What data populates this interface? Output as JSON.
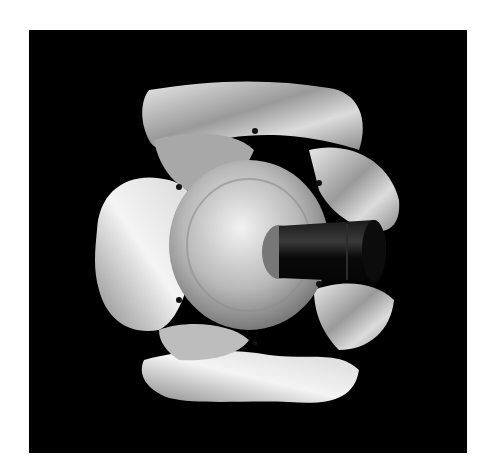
{
  "image": {
    "subject": "metal impeller / fan rotor with wavy petal-shaped blades mounted on a dark shaft",
    "background_color": "#000000",
    "page_background": "#ffffff",
    "metal_tone": "#c8c8c8",
    "shaft_color": "#111111"
  }
}
